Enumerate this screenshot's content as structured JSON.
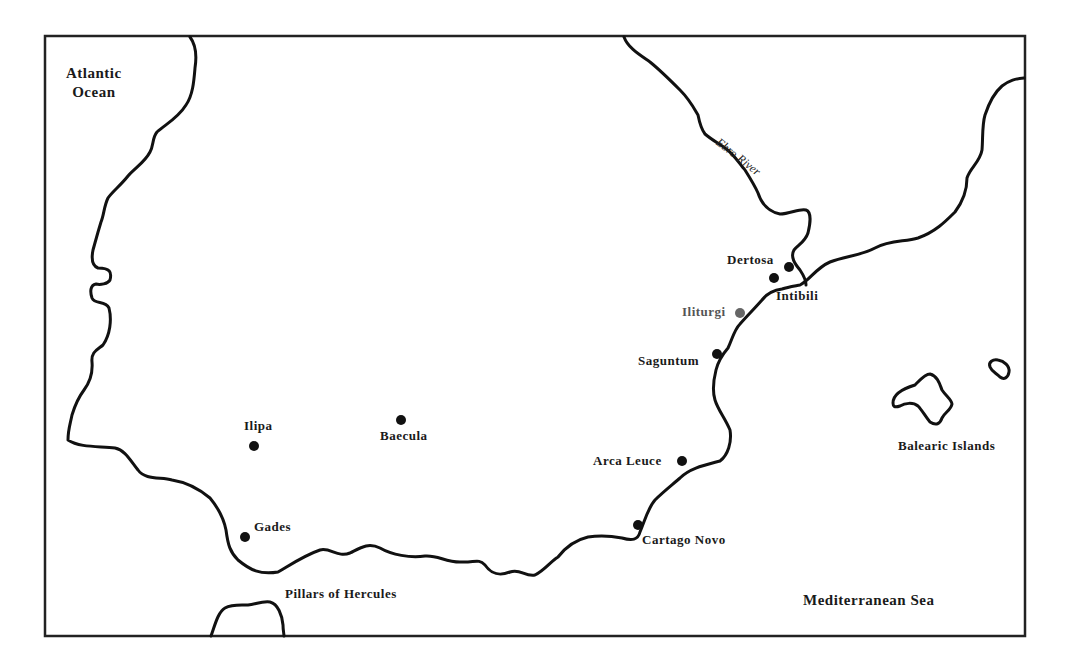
{
  "map": {
    "title_regions": {
      "atlantic": "Atlantic\nOcean",
      "atlantic_line1": "Atlantic",
      "atlantic_line2": "Ocean",
      "mediterranean": "Mediterranean Sea",
      "balearic": "Balearic Islands",
      "pillars": "Pillars of Hercules",
      "river": "Ebro River"
    },
    "cities": [
      {
        "name": "Dertosa",
        "color": "#111111"
      },
      {
        "name": "Intibili",
        "color": "#111111"
      },
      {
        "name": "Iliturgi",
        "color": "#666666"
      },
      {
        "name": "Saguntum",
        "color": "#111111"
      },
      {
        "name": "Arca Leuce",
        "color": "#111111"
      },
      {
        "name": "Cartago Novo",
        "color": "#111111"
      },
      {
        "name": "Baecula",
        "color": "#111111"
      },
      {
        "name": "Ilipa",
        "color": "#111111"
      },
      {
        "name": "Gades",
        "color": "#111111"
      }
    ],
    "colors": {
      "line": "#111111",
      "background": "#ffffff"
    }
  }
}
